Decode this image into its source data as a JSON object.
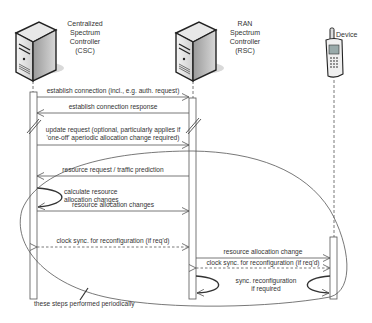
{
  "diagram": {
    "type": "sequence",
    "actors": [
      {
        "id": "csc",
        "lines": [
          "Centralized",
          "Spectrum",
          "Controller",
          "(CSC)"
        ],
        "icon": "server-icon"
      },
      {
        "id": "rsc",
        "lines": [
          "RAN",
          "Spectrum",
          "Controller",
          "(RSC)"
        ],
        "icon": "server-icon"
      },
      {
        "id": "device",
        "lines": [
          "Device"
        ],
        "icon": "mobile-phone-icon"
      }
    ],
    "messages": [
      {
        "from": "csc",
        "to": "rsc",
        "label": "establish connection (incl., e.g. auth. request)",
        "style": "solid"
      },
      {
        "from": "rsc",
        "to": "csc",
        "label": "establish connection response",
        "style": "solid"
      },
      {
        "from": "csc",
        "to": "rsc",
        "label_lines": [
          "update request (optional, particularly applies if",
          "'one-off' aperiodic allocation change required)"
        ],
        "style": "solid"
      },
      {
        "from": "rsc",
        "to": "csc",
        "label": "resource request / traffic prediction",
        "style": "solid"
      },
      {
        "from": "csc",
        "to": "csc",
        "label_lines": [
          "calculate resource",
          "allocation changes"
        ],
        "style": "self"
      },
      {
        "from": "csc",
        "to": "rsc",
        "label": "resource allocation changes",
        "style": "solid"
      },
      {
        "from": "csc",
        "to": "rsc",
        "label": "clock sync. for reconfiguration (if req'd)",
        "style": "dashed-bidirectional"
      },
      {
        "from": "rsc",
        "to": "device",
        "label": "resource allocation change",
        "style": "solid"
      },
      {
        "from": "rsc",
        "to": "device",
        "label": "clock sync. for reconfiguration (if req'd)",
        "style": "dashed-bidirectional"
      },
      {
        "from": "rsc",
        "to": "rsc",
        "label_lines": [
          "sync. reconfiguration",
          "if required"
        ],
        "style": "self"
      },
      {
        "from": "device",
        "to": "device",
        "style": "self"
      }
    ],
    "annotation": "these steps performed periodically"
  }
}
